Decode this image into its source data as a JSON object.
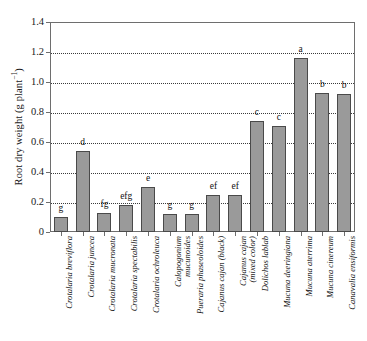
{
  "chart_data": {
    "type": "bar",
    "title": "",
    "xlabel": "",
    "ylabel": "Root dry weight (g plant⁻¹)",
    "ylabel_main": "Root dry weight (g plant",
    "ylabel_sup": "−1",
    "ylabel_tail": ")",
    "ylim": [
      0,
      1.4
    ],
    "ytick_labels": [
      "0",
      "0.2",
      "0.4",
      "0.6",
      "0.8",
      "1.0",
      "1.2",
      "1.4"
    ],
    "ytick_values": [
      0,
      0.2,
      0.4,
      0.6,
      0.8,
      1.0,
      1.2,
      1.4
    ],
    "grid": "horizontal-dotted",
    "legend": "none",
    "bar_color": "#9a9a9a",
    "bar_edge_color": "#4a4a4a",
    "categories": [
      "Crotalaria breviflora",
      "Crotalaria juncea",
      "Crotalaria mucronata",
      "Crotalaria spectabilis",
      "Crotalaria ochroleuca",
      "Calopogonium mucunoides",
      "Pueraria phaseoloides",
      "Cajanus cajan (black)",
      "Cajanus cajan (mixed color)",
      "Dolichos lablab",
      "Mucuna deeringiana",
      "Mucuna aterrima",
      "Mucuna cinereum",
      "Canavalia ensiformis"
    ],
    "category_lines": [
      [
        "Crotalaria breviflora",
        ""
      ],
      [
        "Crotalaria juncea",
        ""
      ],
      [
        "Crotalaria mucronata",
        ""
      ],
      [
        "Crotalaria spectabilis",
        ""
      ],
      [
        "Crotalaria ochroleuca",
        ""
      ],
      [
        "Calopogonium",
        "mucunoides"
      ],
      [
        "Pueraria phaseoloides",
        ""
      ],
      [
        "Cajanus cajan (black)",
        ""
      ],
      [
        "Cajanus cajan",
        "(mixed color)"
      ],
      [
        "Dolichos lablab",
        ""
      ],
      [
        "Mucuna deeringiana",
        ""
      ],
      [
        "Mucuna aterrima",
        ""
      ],
      [
        "Mucuna cinereum",
        ""
      ],
      [
        "Canavalia ensiformis",
        ""
      ]
    ],
    "values": [
      0.1,
      0.54,
      0.13,
      0.18,
      0.3,
      0.12,
      0.12,
      0.25,
      0.25,
      0.74,
      0.71,
      1.16,
      0.93,
      0.92
    ],
    "annotations": [
      "g",
      "d",
      "fg",
      "efg",
      "e",
      "g",
      "g",
      "ef",
      "ef",
      "c",
      "c",
      "a",
      "b",
      "b"
    ]
  }
}
